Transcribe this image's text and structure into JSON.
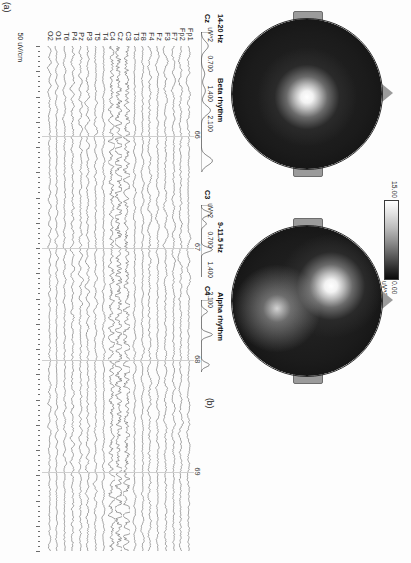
{
  "figure": {
    "panel_a_tag": "(a)",
    "panel_b_tag": "(b)",
    "orientation_note": "rotated"
  },
  "panel_a": {
    "name": "EEG multichannel recording",
    "amplitude_scale": "50 uV/cm",
    "time_axis": {
      "unit": "s",
      "ticks": [
        "66",
        "67",
        "68",
        "69"
      ],
      "tick_values": [
        66,
        67,
        68,
        69
      ],
      "range": [
        65.2,
        69.7
      ]
    },
    "channels": [
      {
        "label": "Fp1",
        "amp": 0.52,
        "freq": 5.4,
        "noise": 0.4
      },
      {
        "label": "Fp2",
        "amp": 0.55,
        "freq": 5.1,
        "noise": 0.44
      },
      {
        "label": "F7",
        "amp": 0.5,
        "freq": 6.2,
        "noise": 0.42
      },
      {
        "label": "F3",
        "amp": 0.54,
        "freq": 5.8,
        "noise": 0.46
      },
      {
        "label": "Fz",
        "amp": 0.48,
        "freq": 6.6,
        "noise": 0.4
      },
      {
        "label": "F4",
        "amp": 0.58,
        "freq": 5.5,
        "noise": 0.5
      },
      {
        "label": "F8",
        "amp": 0.46,
        "freq": 6.0,
        "noise": 0.38
      },
      {
        "label": "T3",
        "amp": 0.44,
        "freq": 7.0,
        "noise": 0.36
      },
      {
        "label": "C3",
        "amp": 1.0,
        "freq": 10.4,
        "noise": 0.62
      },
      {
        "label": "Cz",
        "amp": 1.15,
        "freq": 10.0,
        "noise": 0.7
      },
      {
        "label": "C4",
        "amp": 0.92,
        "freq": 10.8,
        "noise": 0.58
      },
      {
        "label": "T4",
        "amp": 0.46,
        "freq": 6.4,
        "noise": 0.36
      },
      {
        "label": "T5",
        "amp": 0.5,
        "freq": 8.4,
        "noise": 0.4
      },
      {
        "label": "P3",
        "amp": 0.58,
        "freq": 9.2,
        "noise": 0.44
      },
      {
        "label": "Pz",
        "amp": 0.56,
        "freq": 9.6,
        "noise": 0.44
      },
      {
        "label": "P4",
        "amp": 0.6,
        "freq": 9.0,
        "noise": 0.46
      },
      {
        "label": "T6",
        "amp": 0.48,
        "freq": 8.0,
        "noise": 0.38
      },
      {
        "label": "O1",
        "amp": 0.42,
        "freq": 9.8,
        "noise": 0.34
      },
      {
        "label": "O2",
        "amp": 0.5,
        "freq": 9.4,
        "noise": 0.4
      }
    ]
  },
  "panel_b": {
    "colorbar": {
      "max_label": "15.00",
      "min_label": "0.00",
      "unit_label": "uV^2",
      "max_value": 15.0,
      "min_value": 0.0,
      "high_color": "#ffffff",
      "low_color": "#0a0a0a"
    },
    "maps": [
      {
        "rhythm": "Beta rhythm",
        "band_label": "14-20 Hz",
        "band": [
          14,
          20
        ],
        "hotspot": {
          "cx": 0.52,
          "cy": 0.5,
          "r": 0.2,
          "peak": 15.0
        },
        "hotspot2": null
      },
      {
        "rhythm": "Alpha rhythm",
        "band_label": "9-11.5 Hz",
        "band": [
          9,
          11.5
        ],
        "hotspot": {
          "cx": 0.4,
          "cy": 0.34,
          "r": 0.17,
          "peak": 15.0
        },
        "hotspot2": {
          "cx": 0.55,
          "cy": 0.7,
          "r": 0.2,
          "peak": 8.0
        }
      }
    ],
    "spectra": [
      {
        "channel": "Cz",
        "rhythm": "Beta rhythm",
        "band_label": "14-20 Hz",
        "y_unit": "uV^2",
        "y_ticks": [
          "0.700",
          "1.400",
          "2.100"
        ],
        "y_tick_values": [
          0.7,
          1.4,
          2.1
        ],
        "peaks": [
          {
            "x": 0.1,
            "y": 0.62
          },
          {
            "x": 0.3,
            "y": 0.3
          },
          {
            "x": 0.42,
            "y": 0.36
          },
          {
            "x": 0.56,
            "y": 0.82
          },
          {
            "x": 0.92,
            "y": 1.0
          }
        ]
      },
      {
        "channel": "C3",
        "rhythm": "Alpha rhythm",
        "band_label": "9-11.5 Hz",
        "y_unit": "uV^2",
        "y_ticks": [
          "0.700",
          "1.400",
          "2.100"
        ],
        "y_tick_values": [
          0.7,
          1.4,
          2.1
        ],
        "peaks": [
          {
            "x": 0.12,
            "y": 0.9
          },
          {
            "x": 0.26,
            "y": 0.45
          },
          {
            "x": 0.62,
            "y": 1.0
          }
        ]
      },
      {
        "channel": "C4",
        "rhythm": "Alpha rhythm",
        "band_label": "9-11.5 Hz",
        "y_unit": "uV^2",
        "y_ticks": [
          "0.700",
          "1.400",
          "2.100"
        ],
        "y_tick_values": [
          0.7,
          1.4,
          2.1
        ],
        "peaks": [
          {
            "x": 0.16,
            "y": 0.55
          },
          {
            "x": 0.48,
            "y": 1.0
          },
          {
            "x": 0.9,
            "y": 0.72
          }
        ]
      }
    ]
  },
  "chart_data": {
    "type": "line",
    "xlabel": "Time (s)",
    "ylabel": "Channel",
    "xlim": [
      65.2,
      69.7
    ],
    "grid": true,
    "legend": "none",
    "categories": [
      "Fp1",
      "Fp2",
      "F7",
      "F3",
      "Fz",
      "F4",
      "F8",
      "T3",
      "C3",
      "Cz",
      "C4",
      "T4",
      "T5",
      "P3",
      "Pz",
      "P4",
      "T6",
      "O1",
      "O2"
    ],
    "tick_labels_x": [
      "66",
      "67",
      "68",
      "69"
    ],
    "annotations": [
      "50 uV/cm",
      "(a)",
      "(b)",
      "Beta rhythm",
      "14-20 Hz",
      "Alpha rhythm",
      "9-11.5 Hz",
      "Cz",
      "C3",
      "C4",
      "15.00",
      "0.00",
      "uV^2"
    ],
    "series": [
      {
        "name": "Fp1",
        "amplitude_uV": 26
      },
      {
        "name": "Fp2",
        "amplitude_uV": 28
      },
      {
        "name": "F7",
        "amplitude_uV": 25
      },
      {
        "name": "F3",
        "amplitude_uV": 27
      },
      {
        "name": "Fz",
        "amplitude_uV": 24
      },
      {
        "name": "F4",
        "amplitude_uV": 29
      },
      {
        "name": "F8",
        "amplitude_uV": 23
      },
      {
        "name": "T3",
        "amplitude_uV": 22
      },
      {
        "name": "C3",
        "amplitude_uV": 50
      },
      {
        "name": "Cz",
        "amplitude_uV": 58
      },
      {
        "name": "C4",
        "amplitude_uV": 46
      },
      {
        "name": "T4",
        "amplitude_uV": 23
      },
      {
        "name": "T5",
        "amplitude_uV": 25
      },
      {
        "name": "P3",
        "amplitude_uV": 29
      },
      {
        "name": "Pz",
        "amplitude_uV": 28
      },
      {
        "name": "P4",
        "amplitude_uV": 30
      },
      {
        "name": "T6",
        "amplitude_uV": 24
      },
      {
        "name": "O1",
        "amplitude_uV": 21
      },
      {
        "name": "O2",
        "amplitude_uV": 25
      }
    ],
    "topographies": [
      {
        "name": "Beta rhythm",
        "band_hz": [
          14,
          20
        ],
        "scale_uV2": [
          0,
          15
        ]
      },
      {
        "name": "Alpha rhythm",
        "band_hz": [
          9,
          11.5
        ],
        "scale_uV2": [
          0,
          15
        ]
      }
    ],
    "spectra_axes": {
      "y_unit": "uV^2",
      "y_ticks": [
        0.7,
        1.4,
        2.1
      ]
    }
  }
}
